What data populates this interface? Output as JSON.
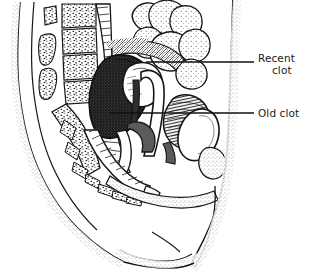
{
  "figure": {
    "kind": "medical-line-illustration",
    "view": "female pelvis, mid-sagittal section",
    "background_color": "#ffffff",
    "ink_color": "#141414",
    "width": 309,
    "height": 280
  },
  "callouts": [
    {
      "id": "recent-clot",
      "line1": "Recent",
      "line2": "clot",
      "full_text": "Recent clot",
      "leader": {
        "x1": 146,
        "y1": 62,
        "x2": 254,
        "y2": 62
      },
      "text_x": 258,
      "text_y": 52
    },
    {
      "id": "old-clot",
      "line1": "Old clot",
      "line2": "",
      "full_text": "Old clot",
      "leader": {
        "x1": 110,
        "y1": 113,
        "x2": 254,
        "y2": 113
      },
      "text_x": 258,
      "text_y": 107
    }
  ],
  "anatomy": {
    "structures": [
      "lumbar vertebrae",
      "sacrum",
      "coccyx",
      "loops of small bowel",
      "rectum",
      "uterus",
      "vagina",
      "bladder",
      "symphysis pubis",
      "abdominal wall",
      "thigh"
    ],
    "shading": {
      "recent_clot_fill": "#1c1c1c",
      "recent_clot_texture": "dense stipple",
      "old_clot_fill": "#6b6b6b",
      "old_clot_texture": "fine line hatching",
      "peritoneal_hatch": "diagonal cross-hatch",
      "bone_texture": "trabecular stipple",
      "soft_tissue_texture": "edge stipple"
    }
  }
}
